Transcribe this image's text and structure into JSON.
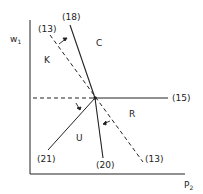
{
  "axes": {
    "y_label": "w",
    "y_label_sub": "1",
    "x_label": "P",
    "x_label_sub": "2"
  },
  "lines": {
    "line_18": "(18)",
    "line_13_top": "(13)",
    "line_15": "(15)",
    "line_21": "(21)",
    "line_20": "(20)",
    "line_13_bottom": "(13)"
  },
  "regions": {
    "C": "C",
    "K": "K",
    "R": "R",
    "U": "U"
  },
  "colors": {
    "ink": "#222222",
    "background": "#ffffff"
  }
}
